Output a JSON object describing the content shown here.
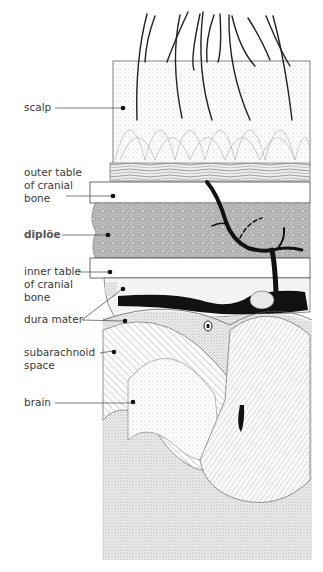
{
  "diagram": {
    "labels": [
      {
        "id": "scalp",
        "lines": [
          "scalp"
        ]
      },
      {
        "id": "outer-table",
        "lines": [
          "outer table",
          "of cranial",
          "bone"
        ]
      },
      {
        "id": "diploe",
        "lines": [
          "diplöe"
        ],
        "bold": true
      },
      {
        "id": "inner-table",
        "lines": [
          "inner table",
          "of cranial",
          "bone"
        ]
      },
      {
        "id": "dura-mater",
        "lines": [
          "dura mater"
        ]
      },
      {
        "id": "subarachnoid",
        "lines": [
          "subarachnoid",
          "space"
        ]
      },
      {
        "id": "brain",
        "lines": [
          "brain"
        ]
      }
    ]
  }
}
